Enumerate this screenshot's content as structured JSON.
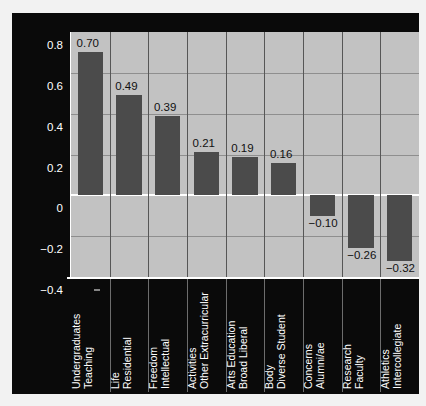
{
  "chart_data": {
    "type": "bar",
    "title": "",
    "xlabel": "",
    "ylabel": "Desired Change from Present Degree of Institutional Emphasis",
    "ylabel_lines": [
      "Desired Change from Present Degree",
      "of Institutional Emphasis"
    ],
    "categories": [
      "Teaching Undergraduates",
      "Residential Life",
      "Intellectual Freedom",
      "Other Extracurricular Activities",
      "Broad Liberal Arts Education",
      "Diverse Student Body",
      "Alumni/ae Concerns",
      "Faculty Research",
      "Intercollegiate Athletics"
    ],
    "category_lines": [
      [
        "Teaching",
        "Undergraduates"
      ],
      [
        "Residential",
        "Life"
      ],
      [
        "Intellectual",
        "Freedom"
      ],
      [
        "Other Extracurricular",
        "Activities"
      ],
      [
        "Broad Liberal",
        "Arts Education"
      ],
      [
        "Diverse Student",
        "Body"
      ],
      [
        "Alumni/ae",
        "Concerns"
      ],
      [
        "Faculty",
        "Research"
      ],
      [
        "Intercollegiate",
        "Athletics"
      ]
    ],
    "values": [
      0.7,
      0.49,
      0.39,
      0.21,
      0.19,
      0.16,
      -0.1,
      -0.26,
      -0.32
    ],
    "value_labels": [
      "0.70",
      "0.49",
      "0.39",
      "0.21",
      "0.19",
      "0.16",
      "−0.10",
      "−0.26",
      "−0.32"
    ],
    "ylim": [
      -0.4,
      0.8
    ],
    "yticks": [
      0.8,
      0.6,
      0.4,
      0.2,
      0,
      -0.2,
      -0.4
    ],
    "ytick_labels": [
      "0.8",
      "0.6",
      "0.4",
      "0.2",
      "0",
      "−0.2",
      "−0.4"
    ],
    "grid": "horizontal-and-vertical",
    "legend": "none",
    "colors": {
      "figure_background": "#0a0a0a",
      "plot_background": "#c2c2c2",
      "bar_fill": "#4b4b4b",
      "grid_line": "#8e8e8e",
      "category_divider": "#565656",
      "axis_line": "#ffffff",
      "axis_text": "#ffffff",
      "data_label_text": "#111111"
    }
  }
}
